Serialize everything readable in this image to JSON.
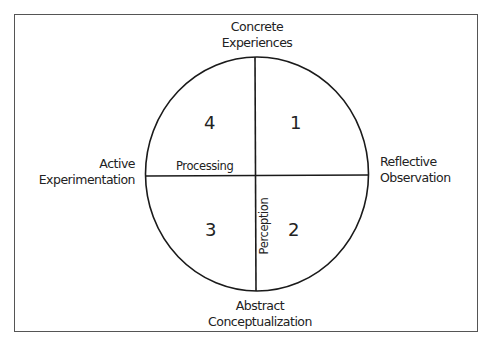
{
  "diagram": {
    "type": "quadrant-circle",
    "poles": {
      "top": [
        "Concrete",
        "Experiences"
      ],
      "bottom": [
        "Abstract",
        "Conceptualization"
      ],
      "left": [
        "Active",
        "Experimentation"
      ],
      "right": [
        "Reflective",
        "Observation"
      ]
    },
    "axes": {
      "horizontal_label": "Processing",
      "vertical_label": "Perception"
    },
    "quadrants": {
      "top_right": "1",
      "bottom_right": "2",
      "bottom_left": "3",
      "top_left": "4"
    },
    "colors": {
      "line": "#1a1a1a",
      "frame": "#555555",
      "background": "#ffffff"
    }
  }
}
